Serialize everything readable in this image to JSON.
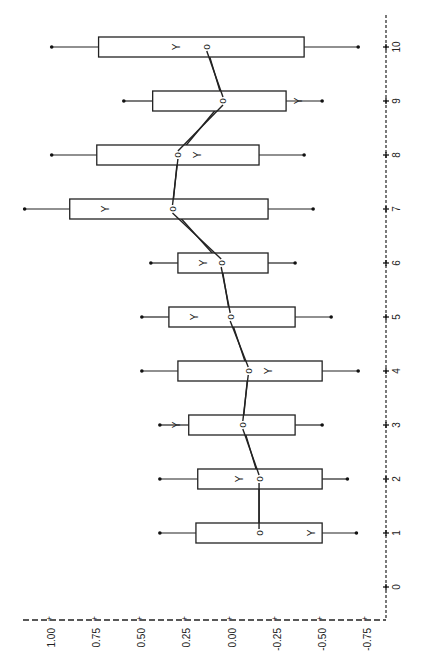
{
  "chart_data": {
    "type": "box",
    "orientation": "rotated-90 (value axis horizontal at bottom, category axis vertical at right)",
    "title": "",
    "xlabel": "",
    "ylabel": "",
    "category_ticks": [
      "0",
      "1",
      "2",
      "3",
      "4",
      "5",
      "6",
      "7",
      "8",
      "9",
      "10"
    ],
    "value_ticks": [
      "1.00",
      "0.75",
      "0.50",
      "0.25",
      "0.00",
      "-0.25",
      "-0.50",
      "-0.75"
    ],
    "value_range": [
      -0.8,
      1.15
    ],
    "category_range": [
      0,
      10
    ],
    "grid": false,
    "legend": null,
    "markers": {
      "o": "observed median (connected by line)",
      "Y": "second marker per box"
    },
    "series": [
      {
        "category": 1,
        "whisker_high": 0.4,
        "box_high": 0.2,
        "box_low": -0.5,
        "whisker_low": -0.69,
        "o": -0.15,
        "Y": -0.44
      },
      {
        "category": 2,
        "whisker_high": 0.4,
        "box_high": 0.19,
        "box_low": -0.5,
        "whisker_low": -0.64,
        "o": -0.15,
        "Y": -0.04
      },
      {
        "category": 3,
        "whisker_high": 0.4,
        "box_high": 0.24,
        "box_low": -0.35,
        "whisker_low": -0.5,
        "o": -0.06,
        "Y": 0.31
      },
      {
        "category": 4,
        "whisker_high": 0.5,
        "box_high": 0.3,
        "box_low": -0.5,
        "whisker_low": -0.7,
        "o": -0.09,
        "Y": -0.2
      },
      {
        "category": 5,
        "whisker_high": 0.5,
        "box_high": 0.35,
        "box_low": -0.35,
        "whisker_low": -0.55,
        "o": 0.01,
        "Y": 0.21
      },
      {
        "category": 6,
        "whisker_high": 0.45,
        "box_high": 0.3,
        "box_low": -0.2,
        "whisker_low": -0.35,
        "o": 0.06,
        "Y": 0.16
      },
      {
        "category": 7,
        "whisker_high": 1.15,
        "box_high": 0.9,
        "box_low": -0.2,
        "whisker_low": -0.45,
        "o": 0.33,
        "Y": 0.7
      },
      {
        "category": 8,
        "whisker_high": 1.0,
        "box_high": 0.75,
        "box_low": -0.15,
        "whisker_low": -0.4,
        "o": 0.3,
        "Y": 0.19
      },
      {
        "category": 9,
        "whisker_high": 0.6,
        "box_high": 0.44,
        "box_low": -0.3,
        "whisker_low": -0.5,
        "o": 0.05,
        "Y": -0.37
      },
      {
        "category": 10,
        "whisker_high": 1.0,
        "box_high": 0.74,
        "box_low": -0.4,
        "whisker_low": -0.7,
        "o": 0.14,
        "Y": 0.31
      }
    ]
  },
  "labels": {
    "o_marker": "o",
    "y_marker": "Y"
  },
  "colors": {
    "ink": "#222222",
    "background": "#ffffff"
  }
}
